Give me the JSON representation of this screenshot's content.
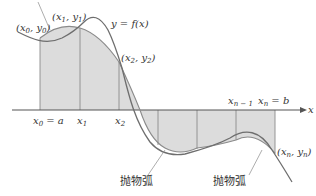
{
  "diagram": {
    "colors": {
      "shade": "#dcdcdc",
      "curve": "#6e6e6e",
      "axis": "#555555",
      "text": "#333333"
    },
    "curve_label": "y = f(x)",
    "axis_label": "x",
    "points": {
      "p0": {
        "x": "x",
        "sub": "0",
        "y": "y",
        "ysub": "0"
      },
      "p1": {
        "x": "x",
        "sub": "1",
        "y": "y",
        "ysub": "1"
      },
      "p2": {
        "x": "x",
        "sub": "2",
        "y": "y",
        "ysub": "2"
      },
      "pn": {
        "x": "x",
        "sub": "n",
        "y": "y",
        "ysub": "n"
      }
    },
    "ticks": {
      "t0": {
        "main": "x",
        "sub": "0",
        "rest": " = a"
      },
      "t1": {
        "main": "x",
        "sub": "1"
      },
      "t2": {
        "main": "x",
        "sub": "2"
      },
      "tn1": {
        "main": "x",
        "sub": "n − 1"
      },
      "tn": {
        "main": "x",
        "sub": "n",
        "rest": " = b"
      }
    },
    "parabola_label_1": "抛物弧",
    "parabola_label_2": "抛物弧"
  }
}
